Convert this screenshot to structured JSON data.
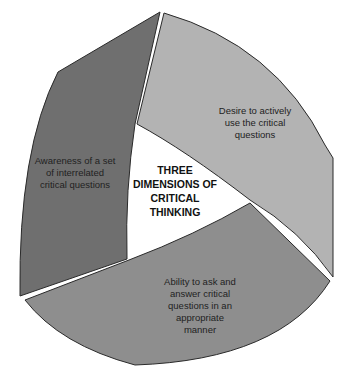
{
  "diagram": {
    "title": "THREE DIMENSIONS OF CRITICAL THINKING",
    "center_lines": [
      "THREE",
      "DIMENSIONS OF",
      "CRITICAL",
      "THINKING"
    ],
    "segments": [
      {
        "id": "awareness",
        "label": "Awareness of a set of interrelated critical questions",
        "lines": [
          "Awareness of a set",
          "of interrelated",
          "critical questions"
        ],
        "color": "#6f6f6f",
        "position": "left"
      },
      {
        "id": "desire",
        "label": "Desire to actively use the critical questions",
        "lines": [
          "Desire to actively",
          "use the critical",
          "questions"
        ],
        "color": "#b3b3b3",
        "position": "top-right"
      },
      {
        "id": "ability",
        "label": "Ability to ask and answer critical questions in an appropriate manner",
        "lines": [
          "Ability to ask and",
          "answer critical",
          "questions in an",
          "appropriate",
          "manner"
        ],
        "color": "#8e8e8e",
        "position": "bottom"
      }
    ],
    "outline_color": "#2a2a2a",
    "background": "#ffffff"
  }
}
